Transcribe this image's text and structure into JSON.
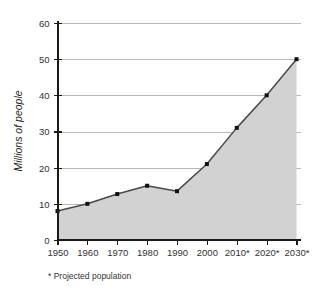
{
  "chart_data": {
    "type": "area",
    "title": "",
    "xlabel": "",
    "ylabel": "Millions of people",
    "categories": [
      "1950",
      "1960",
      "1970",
      "1980",
      "1990",
      "2000",
      "2010*",
      "2020*",
      "2030*"
    ],
    "values": [
      8,
      10,
      12.7,
      15,
      13.5,
      21,
      31,
      40,
      50
    ],
    "ylim": [
      0,
      60
    ],
    "ytick_values": [
      0,
      10,
      20,
      30,
      40,
      50,
      60
    ],
    "ytick_labels": [
      "0",
      "10",
      "20",
      "30",
      "40",
      "50",
      "60"
    ],
    "grid": true,
    "legend": null,
    "annotations": [
      "* Projected population"
    ],
    "colors": {
      "area_fill": "#d2d2d2",
      "line": "#4a4a4a",
      "marker": "#111111",
      "gridline": "#b9b9b9",
      "axis": "#1a1a1a",
      "text": "#333333",
      "background": "#ffffff"
    }
  },
  "footnote": {
    "marker": "*",
    "text": "Projected population",
    "full": "* Projected population"
  },
  "axes": {
    "y_axis_label": "Millions of people"
  }
}
